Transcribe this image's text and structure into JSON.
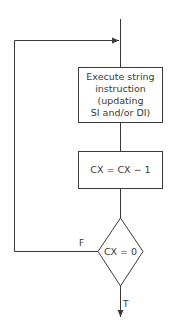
{
  "diagram": {
    "type": "flowchart",
    "colors": {
      "stroke": "#3a3a3a",
      "text": "#3a3a3a",
      "background": "#ffffff"
    },
    "nodes": [
      {
        "id": "execute",
        "shape": "rectangle",
        "lines": [
          "Execute string",
          "instruction",
          "(updating",
          "SI and/or DI)"
        ]
      },
      {
        "id": "decrement",
        "shape": "rectangle",
        "lines": [
          "CX = CX − 1"
        ]
      },
      {
        "id": "test",
        "shape": "diamond",
        "lines": [
          "CX = 0"
        ]
      }
    ],
    "edges": [
      {
        "from": "entry",
        "to": "execute",
        "label": ""
      },
      {
        "from": "execute",
        "to": "decrement",
        "label": ""
      },
      {
        "from": "decrement",
        "to": "test",
        "label": ""
      },
      {
        "from": "test",
        "to": "execute",
        "label": "F"
      },
      {
        "from": "test",
        "to": "exit",
        "label": "T"
      }
    ],
    "labels": {
      "false_branch": "F",
      "true_branch": "T"
    }
  }
}
